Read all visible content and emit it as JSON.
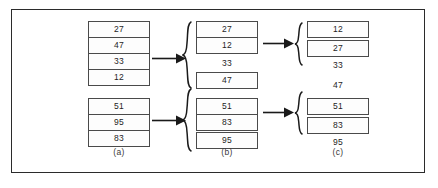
{
  "figure": {
    "type": "merge-sort-diagram",
    "border_color": "#2b2b2b",
    "box_border_color": "#4a4a4a",
    "text_color": "#1d1d1d",
    "captions": [
      {
        "id": "a",
        "label": "(a)"
      },
      {
        "id": "b",
        "label": "(b)"
      },
      {
        "id": "c",
        "label": "(c)"
      }
    ],
    "stages": {
      "a": {
        "caption": "(a)",
        "groups": [
          {
            "boxed": true,
            "values": [
              "27",
              "47",
              "33",
              "12"
            ]
          },
          {
            "boxed": true,
            "values": [
              "51",
              "95",
              "83"
            ]
          }
        ]
      },
      "b": {
        "caption": "(b)",
        "groups": [
          {
            "boxed": true,
            "values": [
              "27",
              "12"
            ]
          },
          {
            "boxed": false,
            "values": [
              "33"
            ]
          },
          {
            "boxed": true,
            "values": [
              "47"
            ]
          },
          {
            "boxed": true,
            "values": [
              "51",
              "83"
            ]
          },
          {
            "boxed": true,
            "values": [
              "95"
            ]
          }
        ]
      },
      "c": {
        "caption": "(c)",
        "groups": [
          {
            "boxed": true,
            "values": [
              "12"
            ]
          },
          {
            "boxed": true,
            "values": [
              "27"
            ]
          },
          {
            "boxed": false,
            "values": [
              "33"
            ]
          },
          {
            "boxed": false,
            "values": [
              "47"
            ]
          },
          {
            "boxed": true,
            "values": [
              "51"
            ]
          },
          {
            "boxed": true,
            "values": [
              "83"
            ]
          },
          {
            "boxed": false,
            "values": [
              "95"
            ]
          }
        ]
      }
    },
    "cells": {
      "a_top": [
        "27",
        "47",
        "33",
        "12"
      ],
      "a_bottom": [
        "51",
        "95",
        "83"
      ],
      "b_top_box": [
        "27",
        "12"
      ],
      "b_top_bare": "33",
      "b_top_single": "47",
      "b_bottom_box": [
        "51",
        "83"
      ],
      "b_bottom_single": "95",
      "c_top_1": "12",
      "c_top_2": "27",
      "c_top_bare_1": "33",
      "c_top_bare_2": "47",
      "c_bottom_1": "51",
      "c_bottom_2": "83",
      "c_bottom_bare": "95"
    },
    "connectors": {
      "arrow_a_top": "arrow-right",
      "arrow_a_bottom": "arrow-right",
      "arrow_b_top": "arrow-right",
      "arrow_b_bottom": "arrow-right",
      "brace_b_top": "{",
      "brace_b_bottom": "{",
      "brace_c_top": "{",
      "brace_c_bottom": "{"
    }
  }
}
